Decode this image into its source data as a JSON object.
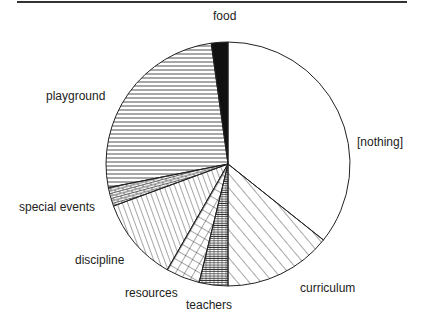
{
  "chart_data": {
    "type": "pie",
    "title": "",
    "start_angle_deg": 0,
    "direction": "clockwise",
    "slices": [
      {
        "label": "[nothing]",
        "value": 35.7,
        "pattern": "none"
      },
      {
        "label": "curriculum",
        "value": 14.3,
        "pattern": "diag-forward"
      },
      {
        "label": "teachers",
        "value": 3.8,
        "pattern": "horizontal-dense"
      },
      {
        "label": "resources",
        "value": 4.5,
        "pattern": "crosshatch"
      },
      {
        "label": "discipline",
        "value": 11.1,
        "pattern": "diag-back"
      },
      {
        "label": "special events",
        "value": 2.5,
        "pattern": "brick"
      },
      {
        "label": "playground",
        "value": 25.9,
        "pattern": "horizontal"
      },
      {
        "label": "food",
        "value": 2.2,
        "pattern": "solid-black"
      }
    ]
  },
  "labels": {
    "food": "food",
    "nothing": "[nothing]",
    "playground": "playground",
    "special_events": "special  events",
    "discipline": "discipline",
    "resources": "resources",
    "teachers": "teachers",
    "curriculum": "curriculum"
  }
}
